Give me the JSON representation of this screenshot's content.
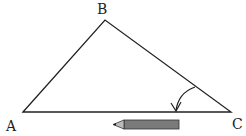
{
  "diagram": {
    "vertices": {
      "A": {
        "label": "A"
      },
      "B": {
        "label": "B"
      },
      "C": {
        "label": "C"
      }
    },
    "colors": {
      "stroke": "#222222",
      "pencil_fill": "#7a7a7a"
    },
    "icons": {
      "rotation_arrow": "curved-arrow-icon",
      "pencil": "pencil-icon"
    }
  }
}
